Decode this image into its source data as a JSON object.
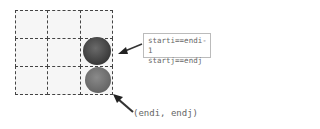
{
  "grid": {
    "rows": 3,
    "cols": 3
  },
  "balls": [
    {
      "row": 1,
      "col": 2,
      "shade": "dark"
    },
    {
      "row": 2,
      "col": 2,
      "shade": "light"
    }
  ],
  "annotation": {
    "line1": "starti==endi-1",
    "line2": "startj==endj"
  },
  "end_label": "(endi, endj)"
}
